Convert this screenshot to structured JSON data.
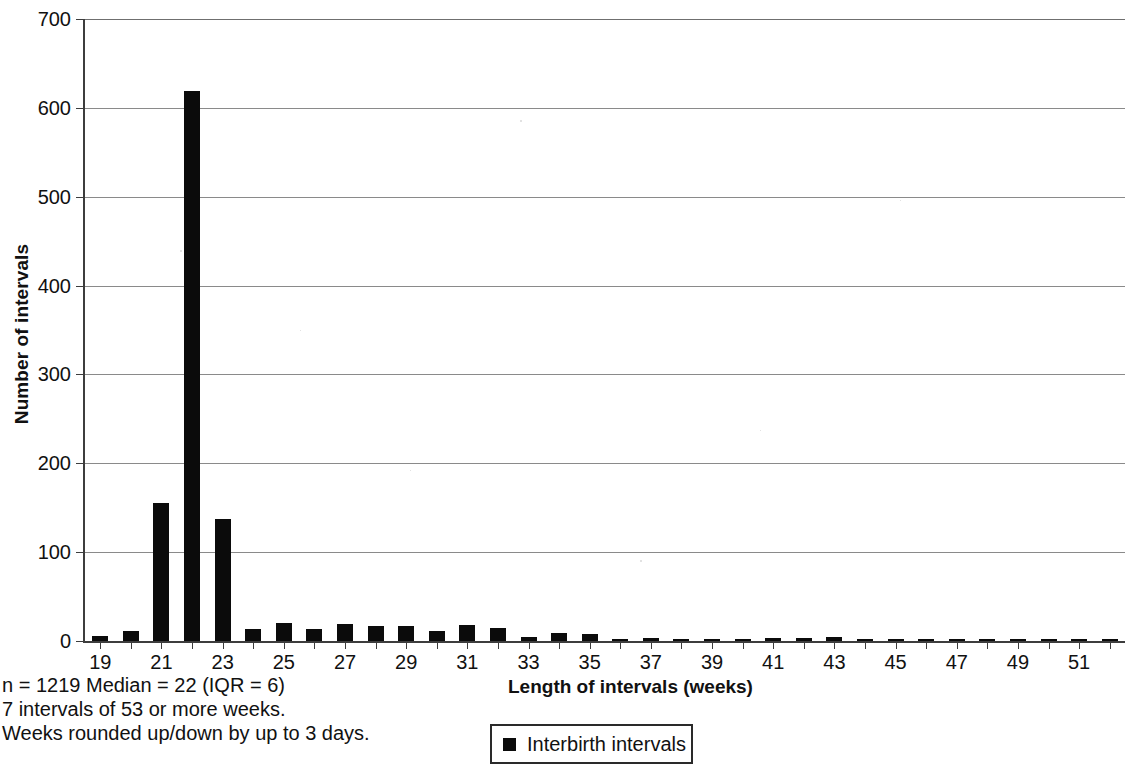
{
  "chart_data": {
    "type": "bar",
    "title": "",
    "xlabel": "Length of intervals (weeks)",
    "ylabel": "Number of intervals",
    "xlim": [
      18.5,
      52.5
    ],
    "ylim": [
      0,
      700
    ],
    "ytick_labels": [
      "0",
      "100",
      "200",
      "300",
      "400",
      "500",
      "600",
      "700"
    ],
    "ytick_values": [
      0,
      100,
      200,
      300,
      400,
      500,
      600,
      700
    ],
    "xtick_labels": [
      "19",
      "21",
      "23",
      "25",
      "27",
      "29",
      "31",
      "33",
      "35",
      "37",
      "39",
      "41",
      "43",
      "45",
      "47",
      "49",
      "51"
    ],
    "xtick_values": [
      19,
      21,
      23,
      25,
      27,
      29,
      31,
      33,
      35,
      37,
      39,
      41,
      43,
      45,
      47,
      49,
      51
    ],
    "grid": "horizontal",
    "legend_position": "below-axis",
    "series": [
      {
        "name": "Interbirth intervals",
        "color": "#0b0b0b",
        "categories": [
          19,
          20,
          21,
          22,
          23,
          24,
          25,
          26,
          27,
          28,
          29,
          30,
          31,
          32,
          33,
          34,
          35,
          36,
          37,
          38,
          39,
          40,
          41,
          42,
          43,
          44,
          45,
          46,
          47,
          48,
          49,
          50,
          51,
          52
        ],
        "values": [
          6,
          11,
          155,
          619,
          137,
          14,
          20,
          13,
          19,
          17,
          17,
          11,
          18,
          15,
          5,
          9,
          8,
          2,
          3,
          1,
          1,
          1,
          3,
          3,
          4,
          1,
          2,
          1,
          1,
          1,
          1,
          1,
          2,
          1
        ]
      }
    ]
  },
  "axis": {
    "y_title": "Number of intervals",
    "x_title": "Length of intervals (weeks)"
  },
  "legend": {
    "entries": [
      {
        "label": "Interbirth intervals",
        "swatch": "black-square-marker"
      }
    ]
  },
  "caption": {
    "line1": "n = 1219 Median = 22 (IQR = 6)",
    "line2": "7 intervals of 53 or more weeks.",
    "line3": "Weeks rounded up/down by up to 3 days."
  },
  "colors": {
    "bar": "#0b0b0b",
    "axis": "#3d3d3d",
    "gridline": "#8a8a8a",
    "background": "#ffffff"
  }
}
